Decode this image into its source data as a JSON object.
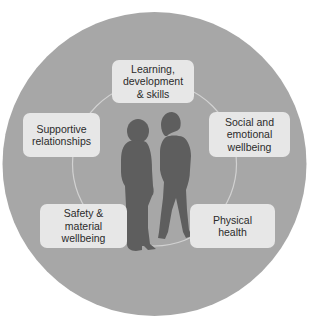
{
  "diagram": {
    "colors": {
      "background": "#ffffff",
      "outer_circle": "#a7a7a7",
      "inner_ring": "#d2d2d2",
      "box_fill": "#e7e7e7",
      "silhouette": "#5e5e5e",
      "text": "#2b2b2b"
    },
    "center_image": "two-children-silhouette",
    "nodes": [
      {
        "id": "learning",
        "lines": [
          "Learning,",
          "development",
          "& skills"
        ]
      },
      {
        "id": "social",
        "lines": [
          "Social and",
          "emotional",
          "wellbeing"
        ]
      },
      {
        "id": "physical",
        "lines": [
          "Physical",
          "health"
        ]
      },
      {
        "id": "safety",
        "lines": [
          "Safety &",
          "material",
          "wellbeing"
        ]
      },
      {
        "id": "supportive",
        "lines": [
          "Supportive",
          "relationships"
        ]
      }
    ]
  }
}
